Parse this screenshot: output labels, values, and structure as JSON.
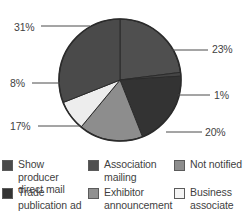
{
  "chart_data": {
    "type": "pie",
    "title": "",
    "subtitle": "",
    "xlabel": "",
    "ylabel": "",
    "legend_position": "bottom",
    "grid": false,
    "labels": [
      "Association mailing",
      "Not notified",
      "Show producer direct mail",
      "Exhibitor announcement",
      "Business associate",
      "Trade publication ad"
    ],
    "values": [
      23,
      1,
      20,
      17,
      8,
      31
    ],
    "value_labels": [
      "23%",
      "1%",
      "20%",
      "17%",
      "8%",
      "31%"
    ],
    "colors": [
      "#4f4f4f",
      "#454545",
      "#333333",
      "#8d8d8d",
      "#ededed",
      "#4a4a4a"
    ],
    "slice_order_clockwise_from_top": [
      "23%",
      "1%",
      "20%",
      "17%",
      "8%",
      "31%"
    ],
    "total": 100
  },
  "pie": {
    "center_x": 120,
    "center_y": 80,
    "radius": 61,
    "outline_color": "#2b2b2b",
    "slices": [
      {
        "name": "association-mailing",
        "value": 23,
        "label": "23%",
        "color": "#4f4f4f",
        "start": 0,
        "end": 82.8
      },
      {
        "name": "not-notified",
        "value": 1,
        "label": "1%",
        "color": "#454545",
        "start": 82.8,
        "end": 86.4
      },
      {
        "name": "show-producer-direct-mail",
        "value": 20,
        "label": "20%",
        "color": "#333333",
        "start": 86.4,
        "end": 158.4
      },
      {
        "name": "exhibitor-announcement",
        "value": 17,
        "label": "17%",
        "color": "#8d8d8d",
        "start": 158.4,
        "end": 219.6
      },
      {
        "name": "business-associate",
        "value": 8,
        "label": "8%",
        "color": "#ededed",
        "start": 219.6,
        "end": 248.4
      },
      {
        "name": "trade-publication-ad",
        "value": 31,
        "label": "31%",
        "color": "#4a4a4a",
        "start": 248.4,
        "end": 360
      }
    ]
  },
  "callouts": [
    {
      "name": "callout-31",
      "label": "31%",
      "label_x": 14,
      "label_y": 22,
      "line_x1": 41,
      "line_y1": 26,
      "line_x2": 90,
      "line_y2": 26
    },
    {
      "name": "callout-23",
      "label": "23%",
      "label_x": 212,
      "label_y": 44,
      "line_x1": 170,
      "line_y1": 50,
      "line_x2": 208,
      "line_y2": 50
    },
    {
      "name": "callout-1",
      "label": "1%",
      "label_x": 214,
      "label_y": 90,
      "line_x1": 178,
      "line_y1": 95,
      "line_x2": 210,
      "line_y2": 95
    },
    {
      "name": "callout-20",
      "label": "20%",
      "label_x": 205,
      "label_y": 127,
      "line_x1": 166,
      "line_y1": 132,
      "line_x2": 202,
      "line_y2": 132
    },
    {
      "name": "callout-17",
      "label": "17%",
      "label_x": 10,
      "label_y": 121,
      "line_x1": 38,
      "line_y1": 126,
      "line_x2": 81,
      "line_y2": 126
    },
    {
      "name": "callout-8",
      "label": "8%",
      "label_x": 10,
      "label_y": 78,
      "line_x1": 32,
      "line_y1": 83,
      "line_x2": 68,
      "line_y2": 83
    }
  ],
  "legend": {
    "rows": [
      [
        {
          "name": "show-producer-direct-mail",
          "label": "Show producer direct mail",
          "color": "#4a4a4a"
        },
        {
          "name": "association-mailing",
          "label": "Association mailing",
          "color": "#4f4f4f"
        },
        {
          "name": "not-notified",
          "label": "Not notified",
          "color": "#8d8d8d"
        }
      ],
      [
        {
          "name": "trade-publication-ad",
          "label": "Trade publication ad",
          "color": "#333333"
        },
        {
          "name": "exhibitor-announcement",
          "label": "Exhibitor announcement",
          "color": "#909090"
        },
        {
          "name": "business-associate",
          "label": "Business associate",
          "color": "#f4f4f4"
        }
      ]
    ]
  }
}
